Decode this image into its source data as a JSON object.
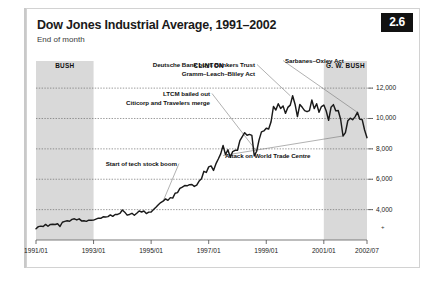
{
  "figure": {
    "badge": "2.6",
    "title": "Dow Jones Industrial Average, 1991–2002",
    "subtitle": "End of month"
  },
  "chart_data": {
    "type": "line",
    "title": "Dow Jones Industrial Average, 1991–2002",
    "subtitle": "End of month",
    "xlabel": "",
    "ylabel": "",
    "grid": true,
    "legend_position": "none",
    "xlim": [
      "1991/01",
      "2002/07"
    ],
    "ylim": [
      2000,
      12600
    ],
    "yticks": [
      4000,
      6000,
      8000,
      10000,
      12000
    ],
    "ytick_labels": [
      "4,000",
      "6,000",
      "8,000",
      "10,000",
      "12,000"
    ],
    "xticks": [
      "1991/01",
      "1993/01",
      "1995/01",
      "1997/01",
      "1999/01",
      "2001/01",
      "2002/07"
    ],
    "x": [
      "1991/01",
      "1991/02",
      "1991/03",
      "1991/04",
      "1991/05",
      "1991/06",
      "1991/07",
      "1991/08",
      "1991/09",
      "1991/10",
      "1991/11",
      "1991/12",
      "1992/01",
      "1992/02",
      "1992/03",
      "1992/04",
      "1992/05",
      "1992/06",
      "1992/07",
      "1992/08",
      "1992/09",
      "1992/10",
      "1992/11",
      "1992/12",
      "1993/01",
      "1993/02",
      "1993/03",
      "1993/04",
      "1993/05",
      "1993/06",
      "1993/07",
      "1993/08",
      "1993/09",
      "1993/10",
      "1993/11",
      "1993/12",
      "1994/01",
      "1994/02",
      "1994/03",
      "1994/04",
      "1994/05",
      "1994/06",
      "1994/07",
      "1994/08",
      "1994/09",
      "1994/10",
      "1994/11",
      "1994/12",
      "1995/01",
      "1995/02",
      "1995/03",
      "1995/04",
      "1995/05",
      "1995/06",
      "1995/07",
      "1995/08",
      "1995/09",
      "1995/10",
      "1995/11",
      "1995/12",
      "1996/01",
      "1996/02",
      "1996/03",
      "1996/04",
      "1996/05",
      "1996/06",
      "1996/07",
      "1996/08",
      "1996/09",
      "1996/10",
      "1996/11",
      "1996/12",
      "1997/01",
      "1997/02",
      "1997/03",
      "1997/04",
      "1997/05",
      "1997/06",
      "1997/07",
      "1997/08",
      "1997/09",
      "1997/10",
      "1997/11",
      "1997/12",
      "1998/01",
      "1998/02",
      "1998/03",
      "1998/04",
      "1998/05",
      "1998/06",
      "1998/07",
      "1998/08",
      "1998/09",
      "1998/10",
      "1998/11",
      "1998/12",
      "1999/01",
      "1999/02",
      "1999/03",
      "1999/04",
      "1999/05",
      "1999/06",
      "1999/07",
      "1999/08",
      "1999/09",
      "1999/10",
      "1999/11",
      "1999/12",
      "2000/01",
      "2000/02",
      "2000/03",
      "2000/04",
      "2000/05",
      "2000/06",
      "2000/07",
      "2000/08",
      "2000/09",
      "2000/10",
      "2000/11",
      "2000/12",
      "2001/01",
      "2001/02",
      "2001/03",
      "2001/04",
      "2001/05",
      "2001/06",
      "2001/07",
      "2001/08",
      "2001/09",
      "2001/10",
      "2001/11",
      "2001/12",
      "2002/01",
      "2002/02",
      "2002/03",
      "2002/04",
      "2002/05",
      "2002/06",
      "2002/07"
    ],
    "values": [
      2736,
      2882,
      2914,
      2888,
      3028,
      2907,
      3025,
      3043,
      3017,
      3069,
      2895,
      3169,
      3223,
      3268,
      3236,
      3359,
      3397,
      3319,
      3394,
      3257,
      3272,
      3226,
      3305,
      3301,
      3310,
      3371,
      3435,
      3428,
      3527,
      3516,
      3539,
      3651,
      3555,
      3681,
      3684,
      3754,
      3978,
      3832,
      3636,
      3682,
      3758,
      3625,
      3765,
      3913,
      3843,
      3908,
      3739,
      3834,
      3844,
      4011,
      4158,
      4321,
      4465,
      4556,
      4708,
      4610,
      4789,
      4756,
      5075,
      5117,
      5395,
      5486,
      5587,
      5569,
      5643,
      5655,
      5529,
      5616,
      5882,
      6029,
      6522,
      6448,
      6813,
      6878,
      6584,
      7009,
      7331,
      7673,
      8222,
      7622,
      7945,
      7442,
      7823,
      7908,
      7907,
      8546,
      8800,
      9063,
      8900,
      8952,
      8883,
      7539,
      7843,
      8592,
      9117,
      9181,
      9359,
      9307,
      9786,
      10789,
      10560,
      10971,
      10655,
      10829,
      10337,
      10730,
      10878,
      11497,
      10941,
      10128,
      10922,
      10734,
      10522,
      10448,
      10522,
      11215,
      10651,
      10971,
      10414,
      10787,
      10887,
      10495,
      9879,
      10735,
      10912,
      10502,
      10523,
      9950,
      8848,
      9075,
      9852,
      10022,
      9920,
      10106,
      10404,
      9946,
      9925,
      9243,
      8737
    ],
    "shaded_regions": [
      {
        "label": "BUSH",
        "start": "1991/01",
        "end": "1993/01"
      },
      {
        "label": "G. W. BUSH",
        "start": "2001/01",
        "end": "2002/07"
      }
    ],
    "era_labels": [
      {
        "text": "BUSH"
      },
      {
        "text": "CLINTON"
      },
      {
        "text": "G. W. BUSH"
      }
    ],
    "annotations": [
      {
        "text": "Deutsche Bank buys Bankers Trust"
      },
      {
        "text": "Gramm–Leach–Bliley Act"
      },
      {
        "text": "LTCM bailed out"
      },
      {
        "text": "Citicorp and Travelers merge"
      },
      {
        "text": "Start of tech stock boom"
      },
      {
        "text": "Sarbanes–Oxley Act"
      },
      {
        "text": "Attack on World Trade Centre"
      }
    ]
  }
}
